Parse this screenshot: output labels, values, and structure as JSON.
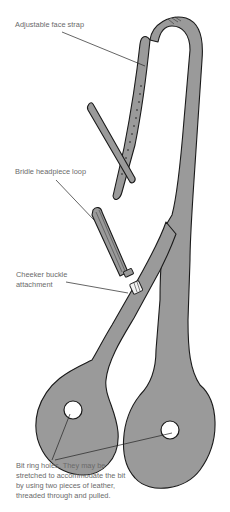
{
  "colors": {
    "leather": "#9a9a9a",
    "outline": "#1a1a1a",
    "label_text": "#6a6a6a",
    "background": "#ffffff"
  },
  "labels": {
    "face_strap": "Adjustable face strap",
    "headpiece_loop": "Bridle headpiece loop",
    "buckle_line1": "Cheeker buckle",
    "buckle_line2": "attachment",
    "holes_line1": "Bit ring holes. They may be",
    "holes_line2": "stretched to accommodate the bit",
    "holes_line3": "by using two pieces of leather,",
    "holes_line4": "threaded through and pulled."
  }
}
